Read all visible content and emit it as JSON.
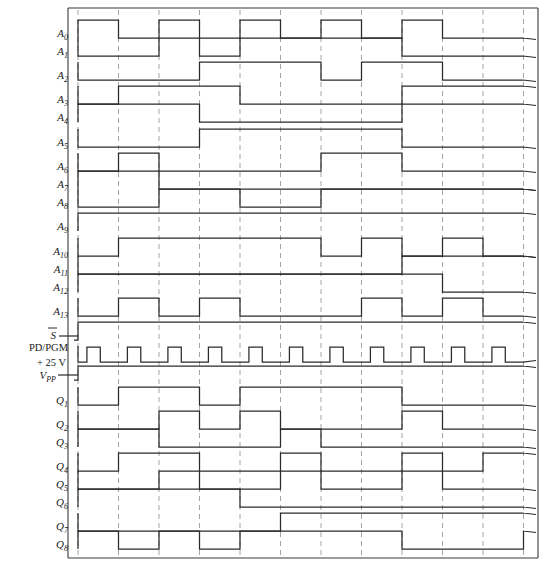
{
  "figure": {
    "kind": "digital-timing-diagram",
    "width": 550,
    "height": 563,
    "background": "#ffffff",
    "trace_color": "#2b2b2b",
    "grid_color": "#9a9a9a",
    "border_color": "#3a3a3a"
  },
  "axes": {
    "plot_left": 78,
    "plot_right": 523,
    "plot_top": 10,
    "plot_bottom": 556,
    "grid_x_start": 78,
    "grid_spacing": 40.5,
    "grid_count": 12,
    "cells": 11,
    "border_left_x": 68,
    "border_right_x": 538,
    "border_top_y": 8,
    "border_bottom_y": 558
  },
  "chart_data": {
    "type": "line",
    "xlabel": "",
    "ylabel": "",
    "grid": true,
    "legend_position": "left-labels",
    "cells": 11,
    "series": [
      {
        "name": "A0",
        "label": "A",
        "sub": "0",
        "y_low": 38,
        "y_high": 20,
        "start": 1,
        "pattern": [
          1,
          0,
          1,
          0,
          1,
          0,
          1,
          0,
          1,
          0,
          0
        ]
      },
      {
        "name": "A1",
        "label": "A",
        "sub": "1",
        "y_low": 56,
        "y_high": 38,
        "start": 0,
        "pattern": [
          0,
          0,
          1,
          0,
          1,
          1,
          1,
          1,
          0,
          0,
          0
        ]
      },
      {
        "name": "A2",
        "label": "A",
        "sub": "2",
        "y_low": 80,
        "y_high": 62,
        "start": 0,
        "pattern": [
          0,
          0,
          0,
          1,
          1,
          1,
          0,
          1,
          1,
          0,
          0
        ]
      },
      {
        "name": "A3",
        "label": "A",
        "sub": "3",
        "y_low": 104,
        "y_high": 86,
        "start": 0,
        "pattern": [
          0,
          1,
          1,
          1,
          0,
          0,
          0,
          0,
          1,
          1,
          1
        ]
      },
      {
        "name": "A4",
        "label": "A",
        "sub": "4",
        "y_low": 122,
        "y_high": 104,
        "start": 1,
        "pattern": [
          1,
          1,
          1,
          0,
          0,
          0,
          0,
          0,
          1,
          1,
          1
        ]
      },
      {
        "name": "A5",
        "label": "A",
        "sub": "5",
        "y_low": 147,
        "y_high": 129,
        "start": 0,
        "pattern": [
          0,
          0,
          0,
          1,
          1,
          1,
          1,
          1,
          0,
          0,
          0
        ]
      },
      {
        "name": "A6",
        "label": "A",
        "sub": "6",
        "y_low": 171,
        "y_high": 153,
        "start": 0,
        "pattern": [
          0,
          1,
          0,
          0,
          0,
          0,
          1,
          1,
          0,
          0,
          0
        ]
      },
      {
        "name": "A7",
        "label": "A",
        "sub": "7",
        "y_low": 189,
        "y_high": 171,
        "start": 1,
        "pattern": [
          1,
          1,
          0,
          0,
          0,
          0,
          0,
          0,
          0,
          0,
          0
        ]
      },
      {
        "name": "A8",
        "label": "A",
        "sub": "8",
        "y_low": 207,
        "y_high": 189,
        "start": 0,
        "pattern": [
          0,
          0,
          1,
          1,
          0,
          0,
          1,
          1,
          1,
          1,
          1
        ]
      },
      {
        "name": "A9",
        "label": "A",
        "sub": "9",
        "y_low": 231,
        "y_high": 213,
        "start": 1,
        "pattern": [
          1,
          1,
          1,
          1,
          1,
          1,
          1,
          1,
          1,
          1,
          1
        ]
      },
      {
        "name": "A10",
        "label": "A",
        "sub": "10",
        "y_low": 256,
        "y_high": 238,
        "start": 0,
        "pattern": [
          0,
          1,
          1,
          1,
          1,
          1,
          0,
          1,
          0,
          1,
          0
        ]
      },
      {
        "name": "A11",
        "label": "A",
        "sub": "11",
        "y_low": 274,
        "y_high": 256,
        "start": 0,
        "pattern": [
          0,
          0,
          0,
          0,
          0,
          0,
          0,
          0,
          1,
          1,
          1
        ]
      },
      {
        "name": "A12",
        "label": "A",
        "sub": "12",
        "y_low": 292,
        "y_high": 274,
        "start": 1,
        "pattern": [
          1,
          1,
          1,
          1,
          1,
          1,
          1,
          1,
          1,
          0,
          0
        ]
      },
      {
        "name": "A13",
        "label": "A",
        "sub": "13",
        "y_low": 316,
        "y_high": 298,
        "start": 0,
        "pattern": [
          0,
          1,
          0,
          1,
          0,
          0,
          0,
          1,
          0,
          1,
          0
        ]
      },
      {
        "name": "Sbar",
        "label": "S",
        "sub": "",
        "y_low": 340,
        "y_high": 322,
        "start": 0,
        "pattern": [
          1,
          1,
          1,
          1,
          1,
          1,
          1,
          1,
          1,
          1,
          1
        ],
        "overline": true,
        "lead_in": true
      },
      {
        "name": "PDPGM",
        "label": "PD/PGM",
        "sub": "",
        "y_low": 362,
        "y_high": 347,
        "start": 0,
        "pulse_per_cell": true,
        "pulse_frac_start": 0.22,
        "pulse_frac_end": 0.55
      },
      {
        "name": "VPP",
        "label": "VPP",
        "sub": "PP",
        "y_low": 380,
        "y_high": 366,
        "start": 0,
        "pattern": [
          1,
          1,
          1,
          1,
          1,
          1,
          1,
          1,
          1,
          1,
          1
        ],
        "lead_in": true,
        "upper_label": "+ 25 V"
      },
      {
        "name": "Q1",
        "label": "Q",
        "sub": "1",
        "y_low": 405,
        "y_high": 387,
        "start": 0,
        "pattern": [
          0,
          1,
          1,
          0,
          1,
          1,
          1,
          1,
          0,
          0,
          0
        ]
      },
      {
        "name": "Q2",
        "label": "Q",
        "sub": "2",
        "y_low": 429,
        "y_high": 411,
        "start": 0,
        "pattern": [
          0,
          0,
          1,
          0,
          1,
          0,
          0,
          0,
          1,
          0,
          0
        ]
      },
      {
        "name": "Q3",
        "label": "Q",
        "sub": "3",
        "y_low": 447,
        "y_high": 429,
        "start": 1,
        "pattern": [
          1,
          1,
          0,
          0,
          0,
          1,
          0,
          0,
          0,
          0,
          0
        ]
      },
      {
        "name": "Q4",
        "label": "Q",
        "sub": "4",
        "y_low": 471,
        "y_high": 453,
        "start": 0,
        "pattern": [
          0,
          1,
          1,
          0,
          0,
          1,
          0,
          0,
          1,
          0,
          1
        ]
      },
      {
        "name": "Q5",
        "label": "Q",
        "sub": "5",
        "y_low": 489,
        "y_high": 471,
        "start": 0,
        "pattern": [
          0,
          0,
          1,
          0,
          0,
          1,
          0,
          0,
          1,
          0,
          0
        ]
      },
      {
        "name": "Q6",
        "label": "Q",
        "sub": "6",
        "y_low": 507,
        "y_high": 489,
        "start": 1,
        "pattern": [
          1,
          1,
          1,
          1,
          0,
          0,
          0,
          0,
          0,
          0,
          0
        ]
      },
      {
        "name": "Q7",
        "label": "Q",
        "sub": "7",
        "y_low": 531,
        "y_high": 513,
        "start": 0,
        "pattern": [
          0,
          0,
          0,
          0,
          0,
          1,
          1,
          1,
          1,
          1,
          1
        ]
      },
      {
        "name": "Q8",
        "label": "Q",
        "sub": "8",
        "y_low": 549,
        "y_high": 531,
        "start": 1,
        "pattern": [
          1,
          0,
          1,
          0,
          1,
          1,
          1,
          1,
          0,
          0,
          0,
          1
        ]
      }
    ]
  },
  "labels": {
    "address_lines": [
      "A0",
      "A1",
      "A2",
      "A3",
      "A4",
      "A5",
      "A6",
      "A7",
      "A8",
      "A9",
      "A10",
      "A11",
      "A12",
      "A13"
    ],
    "control_lines": [
      "S",
      "PD/PGM",
      "VPP"
    ],
    "data_lines": [
      "Q1",
      "Q2",
      "Q3",
      "Q4",
      "Q5",
      "Q6",
      "Q7",
      "Q8"
    ],
    "voltage_note": "+ 25 V",
    "chip_select": "S",
    "program_pin": "PD/PGM",
    "program_voltage": "VPP"
  }
}
